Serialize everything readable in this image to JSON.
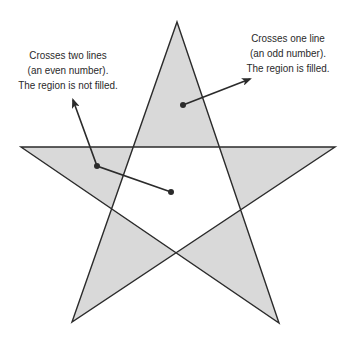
{
  "diagram": {
    "type": "even-odd fill rule illustration",
    "star": {
      "points": [
        [
          177,
          22
        ],
        [
          279,
          323
        ],
        [
          21,
          147
        ],
        [
          335,
          147
        ],
        [
          72,
          322
        ]
      ],
      "fill": "#d9d9d9",
      "stroke": "#2b2b2b"
    },
    "annotations": [
      {
        "id": "even",
        "lines": [
          "Crosses two lines",
          "(an even number).",
          "The region is not filled."
        ],
        "text_center": [
          68,
          48
        ],
        "dot": [
          171,
          192
        ],
        "via": [
          97,
          166
        ],
        "arrow_tip": [
          73,
          100
        ]
      },
      {
        "id": "odd",
        "lines": [
          "Crosses one line",
          "(an odd number).",
          "The region is filled."
        ],
        "text_center": [
          288,
          31
        ],
        "dot": [
          183,
          105
        ],
        "arrow_tip": [
          250,
          79
        ]
      }
    ]
  }
}
